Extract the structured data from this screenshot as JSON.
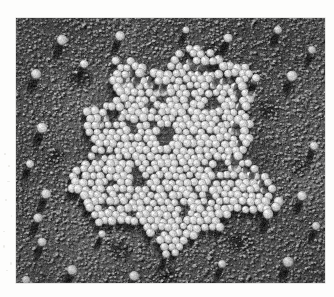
{
  "page": {
    "background_color": "#fdfdfc",
    "width": 334,
    "height": 297
  },
  "figure": {
    "kind": "electron-micrograph",
    "technique": "metal-shadowed / freeze-etch replica",
    "caption": "",
    "plate": {
      "left": 16,
      "top": 18,
      "width": 309,
      "height": 265,
      "background_color": "#6a6a68",
      "border_color": "#cfcfcb"
    },
    "tones": {
      "substrate_mid": "#6a6a68",
      "substrate_dark": "#3a3a38",
      "substrate_light": "#8e8e8a",
      "particle_highlight": "#e8e7e0",
      "particle_body": "#b9b8b0",
      "shadow": "#232322"
    },
    "lighting": {
      "shadow_direction_deg": 250,
      "shadow_length_px": 16,
      "description": "unidirectional metal shadowing; shadows fall down and slightly left"
    },
    "substrate": {
      "grain_count": 14000,
      "grain_radius_min": 0.7,
      "grain_radius_max": 2.1,
      "blotch_count": 46
    },
    "aggregate": {
      "label": "paracrystalline particle aggregate",
      "center_x": 162,
      "center_y": 128,
      "radius_x": 96,
      "radius_y": 92,
      "boundary_roughness": 0.17,
      "particle_diameter_px": 8.4,
      "packing_spacing_px": 7.4,
      "particle_count_estimate": 620,
      "internal_voids": [
        {
          "x": 150,
          "y": 118,
          "r": 9
        },
        {
          "x": 196,
          "y": 84,
          "r": 7
        },
        {
          "x": 122,
          "y": 160,
          "r": 8
        },
        {
          "x": 206,
          "y": 150,
          "r": 7
        },
        {
          "x": 96,
          "y": 96,
          "r": 6
        },
        {
          "x": 168,
          "y": 196,
          "r": 7
        },
        {
          "x": 238,
          "y": 112,
          "r": 6
        }
      ]
    },
    "isolated_particles": [
      {
        "x": 46,
        "y": 22,
        "r": 5.4
      },
      {
        "x": 104,
        "y": 18,
        "r": 5.0
      },
      {
        "x": 212,
        "y": 20,
        "r": 4.6
      },
      {
        "x": 262,
        "y": 12,
        "r": 4.2
      },
      {
        "x": 20,
        "y": 56,
        "r": 5.2
      },
      {
        "x": 68,
        "y": 46,
        "r": 4.4
      },
      {
        "x": 276,
        "y": 58,
        "r": 5.6
      },
      {
        "x": 296,
        "y": 32,
        "r": 4.0
      },
      {
        "x": 26,
        "y": 110,
        "r": 5.4
      },
      {
        "x": 14,
        "y": 146,
        "r": 4.2
      },
      {
        "x": 30,
        "y": 176,
        "r": 5.0
      },
      {
        "x": 22,
        "y": 200,
        "r": 4.8
      },
      {
        "x": 26,
        "y": 224,
        "r": 4.6
      },
      {
        "x": 56,
        "y": 252,
        "r": 5.2
      },
      {
        "x": 118,
        "y": 258,
        "r": 5.0
      },
      {
        "x": 10,
        "y": 262,
        "r": 4.4
      },
      {
        "x": 150,
        "y": 236,
        "r": 4.0
      },
      {
        "x": 252,
        "y": 196,
        "r": 5.4
      },
      {
        "x": 286,
        "y": 178,
        "r": 5.0
      },
      {
        "x": 272,
        "y": 244,
        "r": 5.6
      },
      {
        "x": 300,
        "y": 208,
        "r": 4.2
      },
      {
        "x": 206,
        "y": 246,
        "r": 4.0
      },
      {
        "x": 240,
        "y": 60,
        "r": 4.2
      },
      {
        "x": 298,
        "y": 128,
        "r": 4.4
      },
      {
        "x": 86,
        "y": 216,
        "r": 3.8
      },
      {
        "x": 170,
        "y": 12,
        "r": 3.6
      }
    ],
    "dark_patches": [
      {
        "x": 64,
        "y": 60,
        "rx": 16,
        "ry": 13
      },
      {
        "x": 196,
        "y": 34,
        "rx": 14,
        "ry": 11
      },
      {
        "x": 252,
        "y": 92,
        "rx": 13,
        "ry": 12
      },
      {
        "x": 40,
        "y": 140,
        "rx": 12,
        "ry": 10
      },
      {
        "x": 104,
        "y": 232,
        "rx": 15,
        "ry": 11
      },
      {
        "x": 224,
        "y": 224,
        "rx": 17,
        "ry": 12
      },
      {
        "x": 150,
        "y": 258,
        "rx": 14,
        "ry": 10
      },
      {
        "x": 284,
        "y": 150,
        "rx": 12,
        "ry": 10
      }
    ]
  },
  "margin": {
    "artifact_count": 9,
    "artifact_color": "#dcdcd8"
  }
}
